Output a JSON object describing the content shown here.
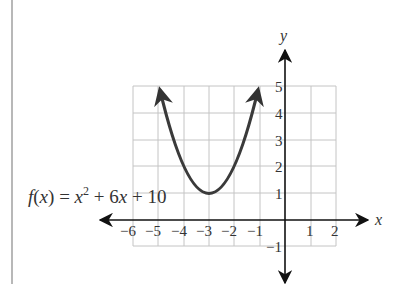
{
  "figure": {
    "function_label": {
      "name": "f",
      "arg": "x",
      "equals": "=",
      "term1_base": "x",
      "term1_exp": "2",
      "plus1": "+",
      "term2": "6x",
      "plus2": "+",
      "constant": "10"
    },
    "x_axis_label": "x",
    "y_axis_label": "y",
    "x_tick_labels": [
      "−6",
      "−5",
      "−4",
      "−3",
      "−2",
      "−1",
      "1",
      "2"
    ],
    "y_tick_labels": [
      "5",
      "4",
      "3",
      "2",
      "1",
      "−1"
    ]
  },
  "chart_data": {
    "type": "line",
    "xlabel": "x",
    "ylabel": "y",
    "xlim": [
      -6,
      2
    ],
    "ylim": [
      -1,
      5
    ],
    "grid": true,
    "x_ticks": [
      -6,
      -5,
      -4,
      -3,
      -2,
      -1,
      1,
      2
    ],
    "y_ticks": [
      -1,
      1,
      2,
      3,
      4,
      5
    ],
    "series": [
      {
        "name": "f(x) = x^2 + 6x + 10",
        "x": [
          -5,
          -4.5,
          -4,
          -3.5,
          -3,
          -2.5,
          -2,
          -1.5,
          -1
        ],
        "y": [
          5,
          3.25,
          2,
          1.25,
          1,
          1.25,
          2,
          3.25,
          5
        ],
        "vertex": [
          -3,
          1
        ],
        "arrows_at_ends": true
      }
    ]
  }
}
